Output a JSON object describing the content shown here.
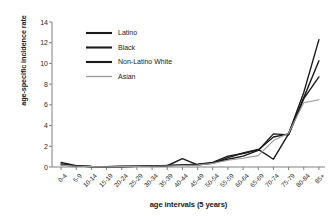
{
  "chart_data": {
    "type": "line",
    "title": "",
    "xlabel": "age intervals (5 years)",
    "ylabel": "age-specific incidence rate",
    "categories": [
      "0-4",
      "5-9",
      "10-14",
      "15-19",
      "20-24",
      "25-29",
      "30-34",
      "35-39",
      "40-44",
      "45-49",
      "50-54",
      "55-59",
      "60-64",
      "65-69",
      "70-74",
      "75-79",
      "80-84",
      "85+"
    ],
    "yticks": [
      0,
      2,
      4,
      6,
      8,
      10,
      12,
      14
    ],
    "ylim": [
      0,
      14
    ],
    "grid": false,
    "legend_position": "upper-left-inside",
    "series": [
      {
        "name": "Latino",
        "color": "#1a1a1a",
        "values": [
          0.45,
          0.12,
          0.05,
          0.04,
          0.05,
          0.06,
          0.08,
          0.12,
          0.8,
          0.2,
          0.35,
          0.9,
          1.35,
          1.7,
          0.75,
          3.2,
          7.2,
          12.3
        ]
      },
      {
        "name": "Black",
        "color": "#1a1a1a",
        "values": [
          0.3,
          0.1,
          0.05,
          0.04,
          0.05,
          0.07,
          0.1,
          0.15,
          0.2,
          0.28,
          0.45,
          1.05,
          1.3,
          1.65,
          2.9,
          3.2,
          6.7,
          10.25
        ]
      },
      {
        "name": "Non-Latino White",
        "color": "#1a1a1a",
        "values": [
          0.22,
          0.08,
          0.04,
          0.04,
          0.05,
          0.06,
          0.09,
          0.13,
          0.18,
          0.22,
          0.4,
          0.75,
          1.05,
          1.6,
          3.2,
          3.1,
          6.6,
          8.7
        ]
      },
      {
        "name": "Asian",
        "color": "#9a9a9a",
        "values": [
          0.18,
          0.07,
          0.04,
          0.03,
          0.04,
          0.05,
          0.07,
          0.1,
          0.14,
          0.18,
          0.35,
          0.65,
          0.85,
          1.1,
          2.55,
          3.25,
          6.2,
          6.5
        ]
      }
    ]
  }
}
